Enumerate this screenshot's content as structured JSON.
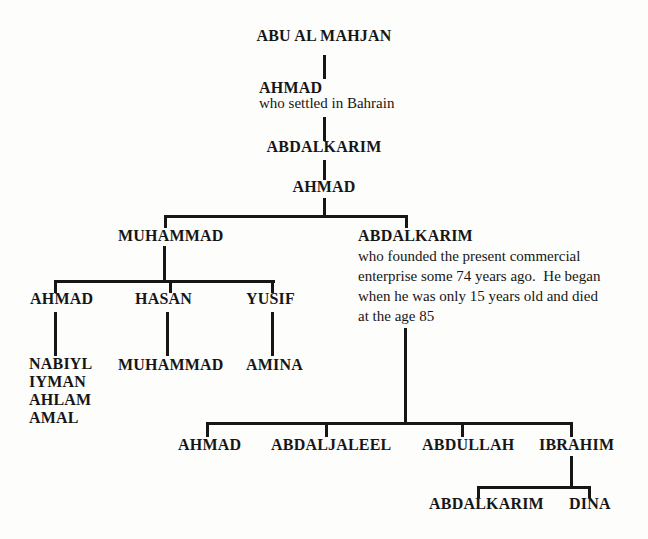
{
  "figure": {
    "background_color": "#fdfdfc",
    "line_color": "#161616",
    "text_color": "#161616"
  },
  "tree": {
    "root": {
      "name": "ABU AL MAHJAN"
    },
    "gen2": {
      "name": "AHMAD",
      "note": "who settled in Bahrain"
    },
    "gen3": {
      "name": "ABDALKARIM"
    },
    "gen4": {
      "name": "AHMAD"
    },
    "gen5": {
      "left": {
        "name": "MUHAMMAD"
      },
      "right": {
        "name": "ABDALKARIM",
        "note_lines": [
          "who founded the present commercial",
          "enterprise some 74 years ago.  He began",
          "when he was only 15 years old and died",
          "at the age 85"
        ]
      }
    },
    "gen6_left": [
      {
        "name": "AHMAD",
        "children": [
          "NABIYL",
          "IYMAN",
          "AHLAM",
          "AMAL"
        ]
      },
      {
        "name": "HASAN",
        "children": [
          "MUHAMMAD"
        ]
      },
      {
        "name": "YUSIF",
        "children": [
          "AMINA"
        ]
      }
    ],
    "gen6_right": [
      {
        "name": "AHMAD"
      },
      {
        "name": "ABDALJALEEL"
      },
      {
        "name": "ABDULLAH"
      },
      {
        "name": "IBRAHIM",
        "children": [
          "ABDALKARIM",
          "DINA"
        ]
      }
    ]
  }
}
